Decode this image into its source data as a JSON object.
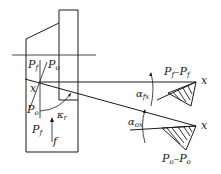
{
  "diagram": {
    "colors": {
      "ink": "#1a1a1a",
      "background": "#ffffff"
    },
    "labels": {
      "pf_top": {
        "main": "P",
        "sub": "f"
      },
      "po_top": {
        "main": "P",
        "sub": "o"
      },
      "x_point": "x",
      "po_left": {
        "main": "P",
        "sub": "o"
      },
      "kappa": {
        "main": "κ",
        "sub": "r"
      },
      "pf_bottom": {
        "main": "P",
        "sub": "f"
      },
      "feed": "f",
      "section_f": {
        "main1": "P",
        "sub1": "f",
        "dash": "–",
        "main2": "P",
        "sub2": "f"
      },
      "x_f": "x",
      "alpha_f": {
        "main": "α",
        "sub": "fx"
      },
      "alpha_o": {
        "main": "α",
        "sub": "ox"
      },
      "x_o": "x",
      "section_o": {
        "main1": "P",
        "sub1": "o",
        "dash": "–",
        "main2": "P",
        "sub2": "o"
      }
    }
  }
}
